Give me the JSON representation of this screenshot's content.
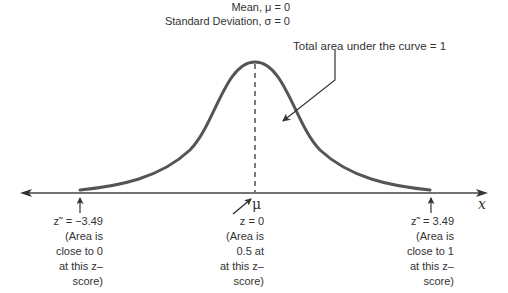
{
  "diagram": {
    "type": "normal-distribution-curve",
    "parameters": {
      "mean_label": "Mean, μ = 0",
      "sd_label": "Standard Deviation, σ = 0"
    },
    "annotation": {
      "area_label": "Total area under the curve = 1"
    },
    "axis": {
      "x_label": "x",
      "mean_symbol": "μ"
    },
    "markers": [
      {
        "id": "left",
        "lines": [
          "z˜ = −3.49",
          "(Area is",
          "close to 0",
          "at this z–",
          "score)"
        ]
      },
      {
        "id": "center",
        "lines": [
          "z = 0",
          "(Area is",
          "0.5 at",
          "at this z–",
          "score)"
        ]
      },
      {
        "id": "right",
        "lines": [
          "z˜ = 3.49",
          "(Area is",
          "close to 1",
          "at this z–",
          "score)"
        ]
      }
    ],
    "colors": {
      "curve": "#555555",
      "axis": "#444444",
      "text": "#333333",
      "background": "#ffffff"
    }
  }
}
